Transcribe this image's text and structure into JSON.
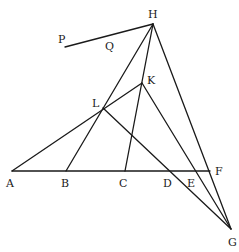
{
  "diagram": {
    "type": "geometric-construction",
    "stroke_color": "#1a1a1a",
    "background": "#ffffff",
    "points": {
      "A": {
        "x": 12,
        "y": 171,
        "label": "A",
        "lx": 6,
        "ly": 187
      },
      "B": {
        "x": 66,
        "y": 171,
        "label": "B",
        "lx": 61,
        "ly": 187
      },
      "C": {
        "x": 125,
        "y": 171,
        "label": "C",
        "lx": 119,
        "ly": 187
      },
      "D": {
        "x": 168,
        "y": 171,
        "label": "D",
        "lx": 163,
        "ly": 187
      },
      "E": {
        "x": 196,
        "y": 171,
        "label": "E",
        "lx": 187,
        "ly": 187
      },
      "F": {
        "x": 210,
        "y": 171,
        "label": "F",
        "lx": 215,
        "ly": 175
      },
      "G": {
        "x": 231,
        "y": 229,
        "label": "G",
        "lx": 228,
        "ly": 246
      },
      "H": {
        "x": 153,
        "y": 24,
        "label": "H",
        "lx": 148,
        "ly": 18
      },
      "K": {
        "x": 142,
        "y": 83,
        "label": "K",
        "lx": 147,
        "ly": 84
      },
      "L": {
        "x": 103,
        "y": 108,
        "label": "L",
        "lx": 92,
        "ly": 107
      },
      "P": {
        "x": 65,
        "y": 47,
        "label": "P",
        "lx": 58,
        "ly": 43
      },
      "Q": {
        "label": "Q",
        "lx": 105,
        "ly": 50
      }
    },
    "segments": [
      [
        "A",
        "F"
      ],
      [
        "P",
        "H"
      ],
      [
        "H",
        "B"
      ],
      [
        "H",
        "C"
      ],
      [
        "H",
        "G"
      ],
      [
        "A",
        "K"
      ],
      [
        "L",
        "G"
      ],
      [
        "K",
        "G"
      ]
    ]
  }
}
